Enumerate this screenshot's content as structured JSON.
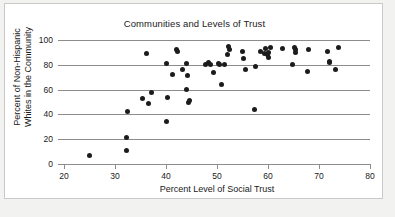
{
  "figure": {
    "title": "Communities and Levels of Trust",
    "background_color": "#ffffff",
    "page_color": "#f2f2f0",
    "frame_color": "#c9c9c9",
    "axis_color": "#8c8c8c",
    "marker_color": "#1c1c1c"
  },
  "chart_data": {
    "type": "scatter",
    "title": "Communities and Levels of Trust",
    "xlabel": "Percent Level of Social Trust",
    "ylabel_line1": "Percent of Non-Hispanic",
    "ylabel_line2": "Whites in the Community",
    "ylabel": "Percent of Non-Hispanic Whites in the Community",
    "xlim": [
      20,
      80
    ],
    "ylim": [
      0,
      100
    ],
    "xticks": [
      20,
      30,
      40,
      50,
      60,
      70,
      80
    ],
    "yticks": [
      0,
      20,
      40,
      60,
      80,
      100
    ],
    "grid": "horizontal",
    "legend": "none",
    "marker": "filled-circle",
    "n_points": 55,
    "points": [
      [
        25.0,
        7
      ],
      [
        32.3,
        11
      ],
      [
        32.3,
        21
      ],
      [
        32.4,
        42
      ],
      [
        35.3,
        53
      ],
      [
        36.2,
        89
      ],
      [
        36.6,
        49
      ],
      [
        37.2,
        58
      ],
      [
        40.0,
        34
      ],
      [
        40.0,
        81
      ],
      [
        40.2,
        54
      ],
      [
        41.3,
        72
      ],
      [
        42.0,
        92
      ],
      [
        42.3,
        91
      ],
      [
        43.2,
        76
      ],
      [
        44.0,
        81
      ],
      [
        44.1,
        60
      ],
      [
        44.3,
        71
      ],
      [
        44.4,
        50
      ],
      [
        44.7,
        51
      ],
      [
        47.8,
        80
      ],
      [
        48.3,
        82
      ],
      [
        48.7,
        80
      ],
      [
        49.4,
        74
      ],
      [
        50.2,
        81
      ],
      [
        50.4,
        80
      ],
      [
        50.8,
        64
      ],
      [
        51.4,
        80
      ],
      [
        52.0,
        88
      ],
      [
        52.3,
        95
      ],
      [
        52.4,
        92
      ],
      [
        55.0,
        91
      ],
      [
        55.2,
        85
      ],
      [
        55.6,
        76
      ],
      [
        57.3,
        44
      ],
      [
        57.6,
        79
      ],
      [
        58.6,
        91
      ],
      [
        59.4,
        89
      ],
      [
        59.6,
        93
      ],
      [
        59.9,
        88
      ],
      [
        60.0,
        90
      ],
      [
        60.1,
        86
      ],
      [
        60.4,
        94
      ],
      [
        62.8,
        93
      ],
      [
        64.9,
        80
      ],
      [
        65.1,
        94
      ],
      [
        65.3,
        90
      ],
      [
        65.4,
        92
      ],
      [
        67.8,
        75
      ],
      [
        68.0,
        92
      ],
      [
        71.6,
        91
      ],
      [
        72.0,
        83
      ],
      [
        72.1,
        82
      ],
      [
        73.2,
        76
      ],
      [
        73.8,
        94
      ]
    ]
  }
}
